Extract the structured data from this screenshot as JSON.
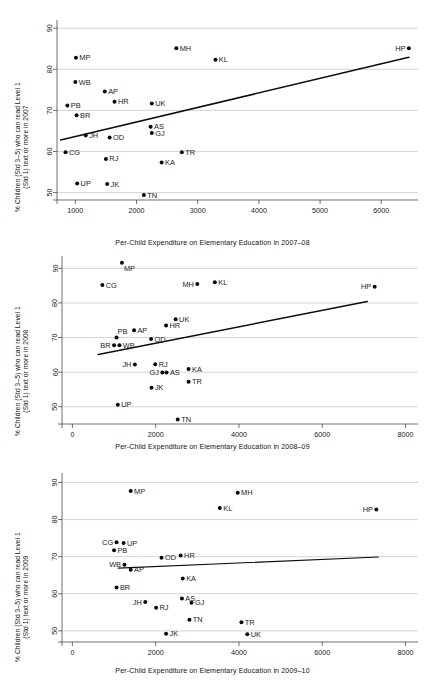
{
  "figure": {
    "title": "",
    "panel_count": 3
  },
  "chart_data": [
    {
      "type": "scatter",
      "title": "",
      "xlabel": "Per-Child Expenditure on Elementary Education in 2007–08",
      "ylabel": "% Children (Std 3–5) who can read Level 1 (Std 1) text or more in 2007",
      "ylabel_line1": "% Children (Std 3–5) who can read Level 1",
      "ylabel_line2": "(Std 1) text or more in 2007",
      "xlim": [
        700,
        6600
      ],
      "ylim": [
        48.2,
        91.5
      ],
      "xticks": [
        1000,
        2000,
        3000,
        4000,
        5000,
        6000
      ],
      "yticks": [
        50,
        60,
        70,
        80,
        90
      ],
      "grid": true,
      "legend": "none",
      "fit_line": {
        "x0": 760,
        "y0": 62.8,
        "x1": 6450,
        "y1": 82.9
      },
      "points": [
        {
          "label": "MP",
          "x": 1010,
          "y": 82.8,
          "label_pos": "right"
        },
        {
          "label": "MH",
          "x": 2650,
          "y": 85.1,
          "label_pos": "right"
        },
        {
          "label": "KL",
          "x": 3290,
          "y": 82.3,
          "label_pos": "right"
        },
        {
          "label": "HP",
          "x": 6450,
          "y": 85.1,
          "label_pos": "left"
        },
        {
          "label": "WB",
          "x": 1000,
          "y": 76.9,
          "label_pos": "right"
        },
        {
          "label": "AP",
          "x": 1480,
          "y": 74.6,
          "label_pos": "right"
        },
        {
          "label": "HR",
          "x": 1640,
          "y": 72.1,
          "label_pos": "right"
        },
        {
          "label": "UK",
          "x": 2250,
          "y": 71.7,
          "label_pos": "right"
        },
        {
          "label": "PB",
          "x": 870,
          "y": 71.2,
          "label_pos": "right"
        },
        {
          "label": "BR",
          "x": 1020,
          "y": 68.8,
          "label_pos": "right"
        },
        {
          "label": "AS",
          "x": 2230,
          "y": 66.0,
          "label_pos": "right"
        },
        {
          "label": "JH",
          "x": 1170,
          "y": 63.9,
          "label_pos": "right"
        },
        {
          "label": "OD",
          "x": 1560,
          "y": 63.4,
          "label_pos": "right"
        },
        {
          "label": "GJ",
          "x": 2250,
          "y": 64.5,
          "label_pos": "right"
        },
        {
          "label": "CG",
          "x": 840,
          "y": 59.8,
          "label_pos": "right"
        },
        {
          "label": "TR",
          "x": 2740,
          "y": 59.8,
          "label_pos": "right"
        },
        {
          "label": "RJ",
          "x": 1500,
          "y": 58.2,
          "label_pos": "right"
        },
        {
          "label": "KA",
          "x": 2410,
          "y": 57.3,
          "label_pos": "right"
        },
        {
          "label": "UP",
          "x": 1030,
          "y": 52.2,
          "label_pos": "right"
        },
        {
          "label": "JK",
          "x": 1520,
          "y": 52.1,
          "label_pos": "right"
        },
        {
          "label": "TN",
          "x": 2120,
          "y": 49.4,
          "label_pos": "right"
        }
      ]
    },
    {
      "type": "scatter",
      "title": "",
      "xlabel": "Per-Child Expenditure on Elementary Education in 2008–09",
      "ylabel": "% Children (Std 3–5) who can read Level 1 (Std 1) text or more in 2008",
      "ylabel_line1": "% Children (Std 3–5) who can read Level 1",
      "ylabel_line2": "(Std 1) text or more in 2008",
      "xlim": [
        -250,
        8300
      ],
      "ylim": [
        45.0,
        93.0
      ],
      "xticks": [
        0,
        2000,
        4000,
        6000,
        8000
      ],
      "yticks": [
        50,
        60,
        70,
        80,
        90
      ],
      "grid": true,
      "legend": "none",
      "fit_line": {
        "x0": 620,
        "y0": 65.1,
        "x1": 7080,
        "y1": 80.4
      },
      "points": [
        {
          "label": "MP",
          "x": 1190,
          "y": 91.6,
          "label_pos": "below-right"
        },
        {
          "label": "CG",
          "x": 720,
          "y": 85.2,
          "label_pos": "right"
        },
        {
          "label": "MH",
          "x": 3000,
          "y": 85.5,
          "label_pos": "left"
        },
        {
          "label": "KL",
          "x": 3420,
          "y": 86.0,
          "label_pos": "right"
        },
        {
          "label": "HP",
          "x": 7260,
          "y": 84.7,
          "label_pos": "left"
        },
        {
          "label": "UK",
          "x": 2480,
          "y": 75.3,
          "label_pos": "right"
        },
        {
          "label": "HR",
          "x": 2250,
          "y": 73.5,
          "label_pos": "right"
        },
        {
          "label": "AP",
          "x": 1480,
          "y": 72.1,
          "label_pos": "right"
        },
        {
          "label": "PB",
          "x": 1060,
          "y": 70.0,
          "label_pos": "above-right"
        },
        {
          "label": "OD",
          "x": 1890,
          "y": 69.6,
          "label_pos": "right"
        },
        {
          "label": "BR",
          "x": 1000,
          "y": 67.8,
          "label_pos": "left"
        },
        {
          "label": "WB",
          "x": 1130,
          "y": 67.8,
          "label_pos": "right"
        },
        {
          "label": "RJ",
          "x": 1990,
          "y": 62.3,
          "label_pos": "right"
        },
        {
          "label": "JH",
          "x": 1500,
          "y": 62.2,
          "label_pos": "left"
        },
        {
          "label": "KA",
          "x": 2790,
          "y": 60.9,
          "label_pos": "right"
        },
        {
          "label": "GJ",
          "x": 2160,
          "y": 59.9,
          "label_pos": "left"
        },
        {
          "label": "AS",
          "x": 2260,
          "y": 59.9,
          "label_pos": "right"
        },
        {
          "label": "TR",
          "x": 2790,
          "y": 57.2,
          "label_pos": "right"
        },
        {
          "label": "JK",
          "x": 1900,
          "y": 55.5,
          "label_pos": "right"
        },
        {
          "label": "UP",
          "x": 1090,
          "y": 50.6,
          "label_pos": "right"
        },
        {
          "label": "TN",
          "x": 2530,
          "y": 46.3,
          "label_pos": "right"
        }
      ]
    },
    {
      "type": "scatter",
      "title": "",
      "xlabel": "Per-Child Expenditure on Elementary Education in 2009–10",
      "ylabel": "% Children (Std 3–5) who can read Level 1 (Std 1) text or more in 2009",
      "ylabel_line1": "% Children (Std 3–5) who can read Level 1",
      "ylabel_line2": "(Std 1) text or more in 2009",
      "xlim": [
        -250,
        8300
      ],
      "ylim": [
        47.0,
        92.0
      ],
      "xticks": [
        0,
        2000,
        4000,
        6000,
        8000
      ],
      "yticks": [
        50,
        60,
        70,
        80,
        90
      ],
      "grid": true,
      "legend": "none",
      "fit_line": {
        "x0": 1100,
        "y0": 66.9,
        "x1": 7350,
        "y1": 69.9
      },
      "points": [
        {
          "label": "MP",
          "x": 1400,
          "y": 87.7,
          "label_pos": "right"
        },
        {
          "label": "MH",
          "x": 3970,
          "y": 87.2,
          "label_pos": "right"
        },
        {
          "label": "KL",
          "x": 3540,
          "y": 83.1,
          "label_pos": "right"
        },
        {
          "label": "HP",
          "x": 7300,
          "y": 82.7,
          "label_pos": "left"
        },
        {
          "label": "CG",
          "x": 1060,
          "y": 73.9,
          "label_pos": "left"
        },
        {
          "label": "UP",
          "x": 1230,
          "y": 73.7,
          "label_pos": "right"
        },
        {
          "label": "PB",
          "x": 1000,
          "y": 71.7,
          "label_pos": "right"
        },
        {
          "label": "OD",
          "x": 2140,
          "y": 69.7,
          "label_pos": "right"
        },
        {
          "label": "HR",
          "x": 2600,
          "y": 70.3,
          "label_pos": "right"
        },
        {
          "label": "WB",
          "x": 1250,
          "y": 67.8,
          "label_pos": "left"
        },
        {
          "label": "AP",
          "x": 1400,
          "y": 66.5,
          "label_pos": "right"
        },
        {
          "label": "KA",
          "x": 2650,
          "y": 64.1,
          "label_pos": "right"
        },
        {
          "label": "BR",
          "x": 1060,
          "y": 61.7,
          "label_pos": "right"
        },
        {
          "label": "AS",
          "x": 2630,
          "y": 58.7,
          "label_pos": "right"
        },
        {
          "label": "JH",
          "x": 1750,
          "y": 57.8,
          "label_pos": "left"
        },
        {
          "label": "GJ",
          "x": 2860,
          "y": 57.6,
          "label_pos": "right"
        },
        {
          "label": "RJ",
          "x": 2010,
          "y": 56.2,
          "label_pos": "right"
        },
        {
          "label": "TN",
          "x": 2810,
          "y": 53.0,
          "label_pos": "right"
        },
        {
          "label": "TR",
          "x": 4060,
          "y": 52.3,
          "label_pos": "right"
        },
        {
          "label": "JK",
          "x": 2250,
          "y": 49.2,
          "label_pos": "right"
        },
        {
          "label": "UK",
          "x": 4200,
          "y": 49.1,
          "label_pos": "right"
        }
      ]
    }
  ],
  "colors": {
    "background": "#ffffff",
    "point": "#0a0a0a",
    "grid": "#b9b9b9",
    "axis": "#4a4a4a",
    "fit": "#0d0d0d",
    "text": "#1a1a1a"
  }
}
